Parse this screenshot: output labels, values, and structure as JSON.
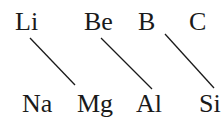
{
  "diagram": {
    "top_row": [
      {
        "symbol": "Li",
        "x": 15,
        "y": 9
      },
      {
        "symbol": "Be",
        "x": 84,
        "y": 9
      },
      {
        "symbol": "B",
        "x": 138,
        "y": 9
      },
      {
        "symbol": "C",
        "x": 189,
        "y": 9
      }
    ],
    "bottom_row": [
      {
        "symbol": "Na",
        "x": 22,
        "y": 91
      },
      {
        "symbol": "Mg",
        "x": 77,
        "y": 91
      },
      {
        "symbol": "Al",
        "x": 136,
        "y": 91
      },
      {
        "symbol": "Si",
        "x": 199,
        "y": 91
      }
    ],
    "diagonal_links": [
      {
        "from": "Li",
        "to": "Mg",
        "x1": 30,
        "y1": 38,
        "x2": 75,
        "y2": 85
      },
      {
        "from": "Be",
        "to": "Al",
        "x1": 101,
        "y1": 38,
        "x2": 152,
        "y2": 89
      },
      {
        "from": "B",
        "to": "Si",
        "x1": 165,
        "y1": 34,
        "x2": 214,
        "y2": 88
      }
    ],
    "colors": {
      "ink": "#1a1a1a",
      "background": "#ffffff"
    }
  }
}
